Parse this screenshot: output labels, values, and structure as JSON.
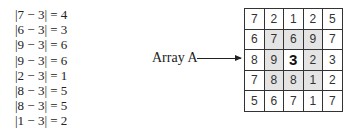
{
  "equations": [
    "|7 − 3| = 4",
    "|6 − 3| = 3",
    "|9 − 3| = 6",
    "|9 − 3| = 6",
    "|2 − 3| = 1",
    "|8 − 3| = 5",
    "|8 − 3| = 5",
    "|1 − 3| = 2"
  ],
  "array_label": "Array A",
  "grid": [
    [
      "7",
      "2",
      "1",
      "2",
      "5"
    ],
    [
      "6",
      "7",
      "6",
      "9",
      "7"
    ],
    [
      "8",
      "9",
      "3",
      "2",
      "3"
    ],
    [
      "7",
      "8",
      "8",
      "1",
      "2"
    ],
    [
      "5",
      "6",
      "7",
      "1",
      "7"
    ]
  ],
  "center_value": "3",
  "colors": {
    "shade": "#e4e4e4",
    "line": "#333333"
  }
}
